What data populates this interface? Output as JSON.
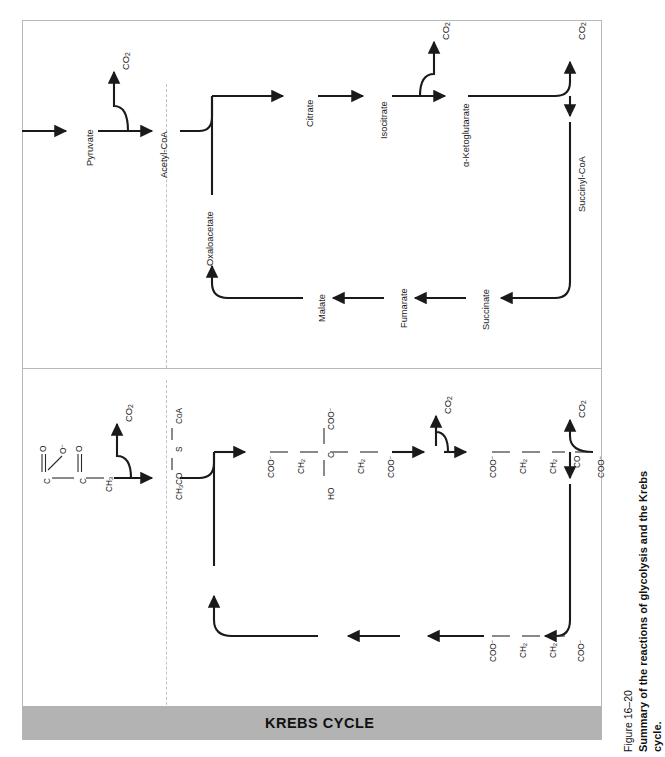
{
  "figure": {
    "number": "Figure 16–20",
    "caption": "Summary of the reactions of glycolysis and the Krebs",
    "caption_line2": "cycle."
  },
  "banner": {
    "label": "KREBS CYCLE",
    "color": "#b3b3b3"
  },
  "colors": {
    "line": "#1a1a1a",
    "frame": "#b9b9b9",
    "divider": "#c2c2c2",
    "banner": "#b3b3b3",
    "text": "#111111"
  },
  "top_panel": {
    "name": "name-pathway-diagram",
    "nodes": [
      {
        "id": "pyruvate",
        "label": "Pyruvate"
      },
      {
        "id": "acetyl-coa",
        "label": "Acetyl-CoA"
      },
      {
        "id": "citrate",
        "label": "Citrate"
      },
      {
        "id": "isocitrate",
        "label": "Isocitrate"
      },
      {
        "id": "alpha-kg",
        "label": "α-Ketoglutarate"
      },
      {
        "id": "succinyl-coa",
        "label": "Succinyl-CoA"
      },
      {
        "id": "succinate",
        "label": "Succinate"
      },
      {
        "id": "fumarate",
        "label": "Fumarate"
      },
      {
        "id": "malate",
        "label": "Malate"
      },
      {
        "id": "oxaloacetate",
        "label": "Oxaloacetate"
      }
    ],
    "byproducts": [
      {
        "id": "co2-pyruvate",
        "label": "CO2",
        "html": "CO<sub>2</sub>"
      },
      {
        "id": "co2-isocitrate",
        "label": "CO2",
        "html": "CO<sub>2</sub>"
      },
      {
        "id": "co2-alphakg",
        "label": "CO2",
        "html": "CO<sub>2</sub>"
      }
    ]
  },
  "bottom_panel": {
    "name": "structure-pathway-diagram",
    "structures": [
      {
        "id": "pyruvate-structure",
        "parts": [
          "C",
          "O",
          "O−",
          "C",
          "O",
          "CH3"
        ],
        "formula": "⁻OOC—CO—CH₃"
      },
      {
        "id": "acetyl-coa-structure",
        "formula": "CH3CO — S — CoA",
        "html": "CH<sub>3</sub>CO — S — CoA"
      },
      {
        "id": "citrate-structure",
        "backbone": [
          "COO−",
          "CH2",
          "C",
          "CH2",
          "COO−"
        ],
        "substituent_up": "COO−",
        "substituent_down": "HO"
      },
      {
        "id": "alpha-ketoglutarate-structure",
        "backbone": [
          "COO−",
          "CH2",
          "CH2",
          "CO",
          "COO−"
        ]
      },
      {
        "id": "succinate-structure",
        "backbone": [
          "COO−",
          "CH2",
          "CH2",
          "COO−"
        ]
      }
    ],
    "byproducts": [
      {
        "id": "co2-pyruvate-struct",
        "html": "CO<sub>2</sub>"
      },
      {
        "id": "co2-isocitrate-struct",
        "html": "CO<sub>2</sub>"
      },
      {
        "id": "co2-alphakg-struct",
        "html": "CO<sub>2</sub>"
      }
    ]
  },
  "labels": {
    "pyruvate": "Pyruvate",
    "acetyl_coa": "Acetyl-CoA",
    "citrate": "Citrate",
    "isocitrate": "Isocitrate",
    "alpha_ketoglutarate": "α-Ketoglutarate",
    "succinyl_coa": "Succinyl-CoA",
    "succinate": "Succinate",
    "fumarate": "Fumarate",
    "malate": "Malate",
    "oxaloacetate": "Oxaloacetate",
    "co2": "CO2",
    "atom_c": "C",
    "atom_o": "O",
    "atom_o_minus": "O",
    "group_ch3": "CH3",
    "group_coo": "COO",
    "group_ch2": "CH2",
    "group_ho": "HO",
    "group_co": "CO",
    "acetyl_coa_formula_a": "CH3CO",
    "acetyl_coa_formula_s": "S",
    "acetyl_coa_formula_coa": "CoA"
  }
}
